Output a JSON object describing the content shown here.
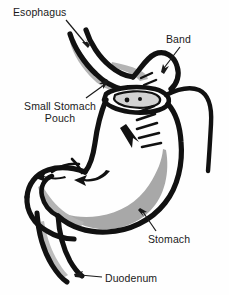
{
  "figure": {
    "background_color": "#fefefe",
    "ink_color": "#111111",
    "shade_color": "#a8a8a8",
    "shade_color_light": "#c4c4c4"
  },
  "labels": {
    "esophagus": "Esophagus",
    "band": "Band",
    "pouch_line1": "Small Stomach",
    "pouch_line2": "Pouch",
    "stomach": "Stomach",
    "duodenum": "Duodenum"
  },
  "structures": [
    {
      "name": "esophagus",
      "label": "Esophagus",
      "description": "Tube entering from upper left, curving down and right into the small pouch",
      "shaded": true
    },
    {
      "name": "small-stomach-pouch",
      "label": "Small Stomach Pouch",
      "description": "Small upper gastric pouch above the band",
      "shaded": true
    },
    {
      "name": "band",
      "label": "Band",
      "description": "Adjustable ring encircling the stomach below the pouch, with connecting tube looping to the right",
      "shaded": false
    },
    {
      "name": "stomach",
      "label": "Stomach",
      "description": "Main gastric body below the band with gray lumen shading and rugae hatching",
      "shaded": true
    },
    {
      "name": "duodenum",
      "label": "Duodenum",
      "description": "Outflow tract curving from the lower left and descending",
      "shaded": true
    }
  ],
  "flow_arrows": [
    {
      "name": "flow-arrow-body",
      "direction": "down-right",
      "location": "stomach body"
    },
    {
      "name": "flow-arrow-antrum-right",
      "direction": "left",
      "location": "antrum"
    },
    {
      "name": "flow-arrow-antrum-left",
      "direction": "left",
      "location": "pylorus"
    }
  ],
  "leader_lines": [
    {
      "name": "leader-esophagus",
      "from_label": "Esophagus",
      "points_to": "esophagus tube"
    },
    {
      "name": "leader-band",
      "from_label": "Band",
      "points_to": "band ring"
    },
    {
      "name": "leader-pouch",
      "from_label": "Small Stomach Pouch",
      "points_to": "upper pouch"
    },
    {
      "name": "leader-stomach",
      "from_label": "Stomach",
      "points_to": "gastric body"
    },
    {
      "name": "leader-duodenum",
      "from_label": "Duodenum",
      "points_to": "duodenal tail"
    }
  ]
}
